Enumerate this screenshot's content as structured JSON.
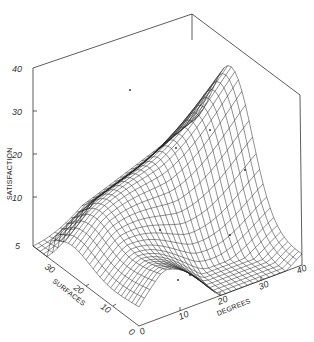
{
  "chart_data": {
    "type": "surface3d",
    "title": "",
    "zlabel": "SATISFACTION",
    "xlabel": "DEGREES",
    "ylabel": "SURFACES",
    "zlim": [
      5,
      40
    ],
    "xlim": [
      0,
      40
    ],
    "ylim": [
      0,
      30
    ],
    "z_ticks": [
      "40",
      "30",
      "20",
      "10",
      "5"
    ],
    "x_ticks": [
      "0",
      "10",
      "20",
      "30",
      "40"
    ],
    "y_ticks": [
      "0",
      "10",
      "20",
      "30"
    ],
    "grid": false,
    "sample_points": [
      {
        "degrees": 0,
        "surfaces": 30,
        "satisfaction": 5
      },
      {
        "degrees": 0,
        "surfaces": 20,
        "satisfaction": 6
      },
      {
        "degrees": 0,
        "surfaces": 10,
        "satisfaction": 14
      },
      {
        "degrees": 0,
        "surfaces": 0,
        "satisfaction": 5
      },
      {
        "degrees": 10,
        "surfaces": 20,
        "satisfaction": 20
      },
      {
        "degrees": 20,
        "surfaces": 20,
        "satisfaction": 26
      },
      {
        "degrees": 20,
        "surfaces": 0,
        "satisfaction": 10
      },
      {
        "degrees": 30,
        "surfaces": 0,
        "satisfaction": 12
      },
      {
        "degrees": 40,
        "surfaces": 0,
        "satisfaction": 12
      },
      {
        "degrees": 40,
        "surfaces": 30,
        "satisfaction": 38
      }
    ]
  },
  "labels": {
    "z_axis": "SATISFACTION",
    "x_axis": "DEGREES",
    "y_axis": "SURFACES",
    "z40": "40",
    "z30": "30",
    "z20": "20",
    "z10": "10",
    "z5": "5",
    "x0": "0",
    "x10": "10",
    "x20": "20",
    "x30": "30",
    "x40": "40",
    "y0": "0",
    "y10": "10",
    "y20": "20",
    "y30": "30"
  }
}
